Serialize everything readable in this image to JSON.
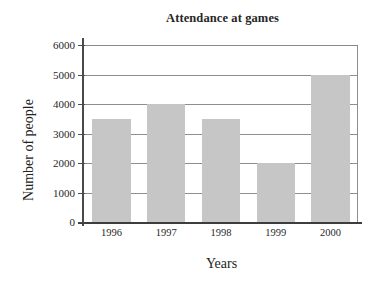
{
  "chart_data": {
    "type": "bar",
    "title": "Attendance at games",
    "xlabel": "Years",
    "ylabel": "Number of people",
    "categories": [
      "1996",
      "1997",
      "1998",
      "1999",
      "2000"
    ],
    "values": [
      3500,
      4000,
      3500,
      2000,
      5000
    ],
    "ylim": [
      0,
      6000
    ],
    "yticks": [
      0,
      1000,
      2000,
      3000,
      4000,
      5000,
      6000
    ],
    "ytick_labels": [
      "0",
      "1000",
      "2000",
      "3000",
      "4000",
      "5000",
      "6000"
    ],
    "grid": "horizontal",
    "legend": "none",
    "series": [
      {
        "name": "Number of people",
        "values": [
          3500,
          4000,
          3500,
          2000,
          5000
        ]
      }
    ],
    "colors": {
      "bar_fill": "#c6c6c6",
      "grid_line": "#8e8e8e",
      "axis_line": "#3d3d3d",
      "text": "#1f1f1f",
      "background": "#ffffff"
    }
  }
}
